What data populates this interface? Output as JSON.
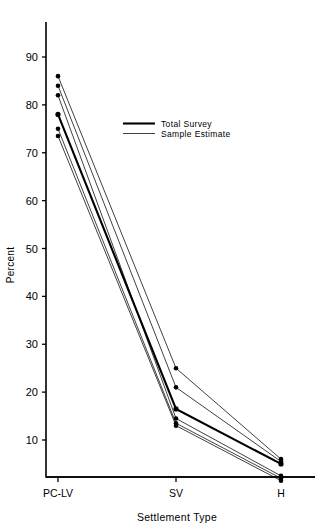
{
  "chart_data": {
    "type": "line",
    "title": "",
    "xlabel": "Settlement Type",
    "ylabel": "Percent",
    "categories": [
      "PC-LV",
      "SV",
      "H"
    ],
    "x_tick_labels": [
      "PC-LV",
      "SV",
      "H"
    ],
    "y_tick_labels": [
      "10",
      "20",
      "30",
      "40",
      "50",
      "60",
      "70",
      "80",
      "90"
    ],
    "y_ticks": [
      10,
      20,
      30,
      40,
      50,
      60,
      70,
      80,
      90
    ],
    "ylim": [
      0,
      95
    ],
    "grid": false,
    "legend_position": "upper-center",
    "legend": [
      {
        "name": "Total Survey",
        "style": "thick"
      },
      {
        "name": "Sample Estimate",
        "style": "thin"
      }
    ],
    "series": [
      {
        "name": "Total Survey",
        "style": "thick",
        "values": [
          78.0,
          16.5,
          5.0
        ]
      },
      {
        "name": "Sample Estimate",
        "style": "thin",
        "values": [
          86.0,
          25.0,
          6.0
        ]
      },
      {
        "name": "Sample Estimate",
        "style": "thin",
        "values": [
          84.0,
          21.0,
          5.5
        ]
      },
      {
        "name": "Sample Estimate",
        "style": "thin",
        "values": [
          82.0,
          14.5,
          2.5
        ]
      },
      {
        "name": "Sample Estimate",
        "style": "thin",
        "values": [
          75.0,
          13.5,
          2.0
        ]
      },
      {
        "name": "Sample Estimate",
        "style": "thin",
        "values": [
          73.5,
          13.0,
          1.5
        ]
      }
    ]
  },
  "axes": {
    "y_title": "Percent",
    "x_title": "Settlement Type"
  },
  "legend_entries": {
    "total_survey": "Total Survey",
    "sample_estimate": "Sample Estimate"
  }
}
